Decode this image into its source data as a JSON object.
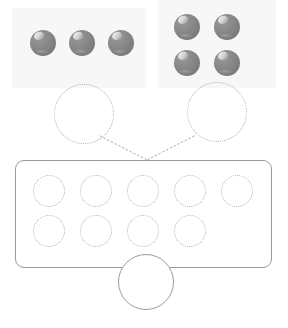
{
  "widget": {
    "name": "addition-counters-exercise",
    "type": "drag-and-drop-number-bond",
    "title": "",
    "instruction": ""
  },
  "colors": {
    "counter_fill": "#828282",
    "counter_highlight": "#ffffff",
    "panel_background": "#f7f7f7",
    "slot_outline": "#b3b3b3",
    "bond_slot_outline": "#b0aec2",
    "frame_border": "#9b9b9b",
    "connector_line": "#a9a9b8",
    "page_background": "#ffffff"
  },
  "groups": [
    {
      "id": "group-left",
      "label": "",
      "count": 3,
      "layout": "row",
      "panel": {
        "x": 12,
        "y": 8,
        "w": 134,
        "h": 80
      },
      "counters": [
        {
          "x": 30,
          "y": 30
        },
        {
          "x": 69,
          "y": 30
        },
        {
          "x": 108,
          "y": 30
        }
      ]
    },
    {
      "id": "group-right",
      "label": "",
      "count": 4,
      "layout": "grid-2x2",
      "panel": {
        "x": 158,
        "y": 0,
        "w": 118,
        "h": 88
      },
      "counters": [
        {
          "x": 174,
          "y": 14
        },
        {
          "x": 214,
          "y": 14
        },
        {
          "x": 174,
          "y": 50
        },
        {
          "x": 214,
          "y": 50
        }
      ]
    }
  ],
  "bond_slots": [
    {
      "id": "bond-slot-left",
      "value": "",
      "x": 54,
      "y": 84,
      "d": 60
    },
    {
      "id": "bond-slot-right",
      "value": "",
      "x": 187,
      "y": 82,
      "d": 60
    }
  ],
  "connectors": [
    {
      "id": "connector-left",
      "from": "bond-slot-left",
      "to": "junction",
      "style": "dotted"
    },
    {
      "id": "connector-right",
      "from": "bond-slot-right",
      "to": "junction",
      "style": "dotted"
    }
  ],
  "junction": {
    "x": 147,
    "y": 160
  },
  "answer_frame": {
    "id": "answer-frame",
    "x": 15,
    "y": 160,
    "w": 257,
    "h": 108,
    "rows": [
      {
        "id": "answer-row-top",
        "count": 5,
        "slots": [
          {
            "id": "answer-slot-1",
            "value": "",
            "x": 33,
            "y": 175
          },
          {
            "id": "answer-slot-2",
            "value": "",
            "x": 80,
            "y": 175
          },
          {
            "id": "answer-slot-3",
            "value": "",
            "x": 127,
            "y": 175
          },
          {
            "id": "answer-slot-4",
            "value": "",
            "x": 174,
            "y": 175
          },
          {
            "id": "answer-slot-5",
            "value": "",
            "x": 221,
            "y": 175
          }
        ]
      },
      {
        "id": "answer-row-bottom",
        "count": 4,
        "slots": [
          {
            "id": "answer-slot-6",
            "value": "",
            "x": 33,
            "y": 215
          },
          {
            "id": "answer-slot-7",
            "value": "",
            "x": 80,
            "y": 215
          },
          {
            "id": "answer-slot-8",
            "value": "",
            "x": 127,
            "y": 215
          },
          {
            "id": "answer-slot-9",
            "value": "",
            "x": 174,
            "y": 215
          }
        ]
      }
    ]
  },
  "total_slot": {
    "id": "total-slot",
    "label": "",
    "value": "",
    "x": 118,
    "y": 254,
    "d": 56
  },
  "accessibility": {
    "left_group_description": "Group of 3 gray counters",
    "right_group_description": "Group of 4 gray counters",
    "frame_description": "Answer box with 9 empty dotted slots",
    "total_description": "Empty total circle"
  }
}
